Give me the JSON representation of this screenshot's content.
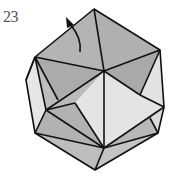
{
  "step": {
    "number": "23"
  },
  "diagram": {
    "colors": {
      "dark_face": "#a9a9a9",
      "mid_face": "#bdbdbd",
      "light_face": "#e4e4e4",
      "edge": "#111111",
      "flap": "#111111"
    }
  }
}
